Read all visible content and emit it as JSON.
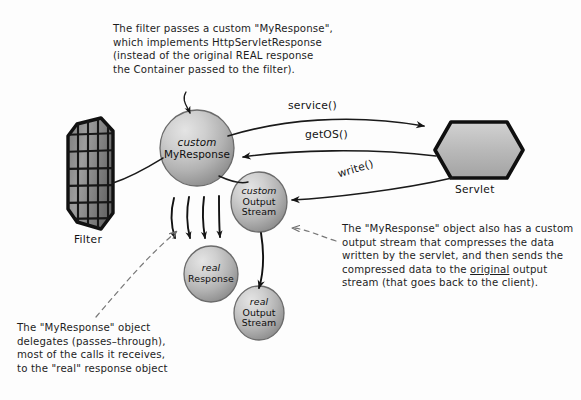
{
  "diagram": {
    "background_color": "#fdfdfd",
    "ink_color": "#1b1b1b",
    "node_fill_color": "#c0c0c0"
  },
  "nodes": {
    "filter": {
      "label": "Filter",
      "shape": "crystal-hexagon-grid",
      "icon": "filter-mesh-icon"
    },
    "custom_my_response": {
      "line1": "custom",
      "line2": "MyResponse",
      "shape": "circle"
    },
    "servlet": {
      "label": "Servlet",
      "shape": "hexagon"
    },
    "custom_output_stream": {
      "line1": "custom",
      "line2": "Output",
      "line3": "Stream",
      "shape": "circle"
    },
    "real_response": {
      "line1": "real",
      "line2": "Response",
      "shape": "circle"
    },
    "real_output_stream": {
      "line1": "real",
      "line2": "Output",
      "line3": "Stream",
      "shape": "circle"
    }
  },
  "arrow_labels": {
    "service": "service()",
    "get_os": "getOS()",
    "write": "write()"
  },
  "notes": {
    "top": "The filter passes a custom \"MyResponse\",\nwhich implements HttpServletResponse\n(instead of the original REAL response\nthe Container passed to the filter).",
    "right_part1": "The \"MyResponse\" object also has a custom\noutput stream that compresses the data\nwritten by the servlet, and then sends the\ncompressed data to the ",
    "right_underlined": "original",
    "right_part2": " output\nstream (that goes back to the client).",
    "bottom_left": "The \"MyResponse\" object\ndelegates (passes–through),\nmost of the calls it receives,\nto the \"real\" response object"
  }
}
